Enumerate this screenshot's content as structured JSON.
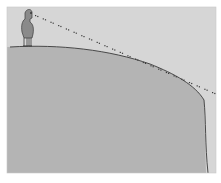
{
  "illustration": {
    "subject": "Person standing on curved ground with a straight dotted line of sight extending past the curving horizon",
    "colors": {
      "background": "#ffffff",
      "sky": "#d6d6d6",
      "ground": "#b4b4b4",
      "outline": "#3a3a3a",
      "sight_line_dots": "#3c3c3c",
      "figure": "#8a8a8a"
    },
    "elements": [
      "frame",
      "sky",
      "ground",
      "horizon-curve",
      "cliff-edge",
      "observer-figure",
      "line-of-sight"
    ]
  }
}
